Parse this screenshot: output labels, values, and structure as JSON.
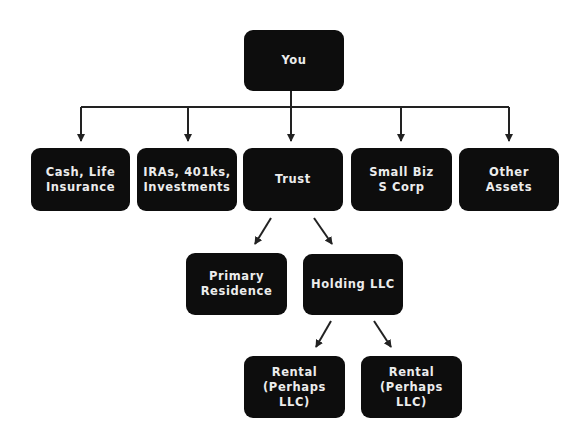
{
  "diagram": {
    "type": "hierarchy",
    "root": {
      "id": "you",
      "label": "You"
    },
    "level1": [
      {
        "id": "cash",
        "label": "Cash, Life Insurance",
        "lines": [
          "Cash, Life",
          "Insurance"
        ]
      },
      {
        "id": "iras",
        "label": "IRAs, 401ks, Investments",
        "lines": [
          "IRAs, 401ks,",
          "Investments"
        ]
      },
      {
        "id": "trust",
        "label": "Trust",
        "lines": [
          "Trust"
        ]
      },
      {
        "id": "smallbiz",
        "label": "Small Biz S Corp",
        "lines": [
          "Small Biz",
          "S Corp"
        ]
      },
      {
        "id": "other",
        "label": "Other Assets",
        "lines": [
          "Other",
          "Assets"
        ]
      }
    ],
    "level2": [
      {
        "id": "primary",
        "parent": "trust",
        "lines": [
          "Primary",
          "Residence"
        ]
      },
      {
        "id": "holding",
        "parent": "trust",
        "lines": [
          "Holding LLC"
        ]
      }
    ],
    "level3": [
      {
        "id": "rental1",
        "parent": "holding",
        "lines": [
          "Rental",
          "(Perhaps LLC)"
        ]
      },
      {
        "id": "rental2",
        "parent": "holding",
        "lines": [
          "Rental",
          "(Perhaps LLC)"
        ]
      }
    ],
    "edges": [
      [
        "you",
        "cash"
      ],
      [
        "you",
        "iras"
      ],
      [
        "you",
        "trust"
      ],
      [
        "you",
        "smallbiz"
      ],
      [
        "you",
        "other"
      ],
      [
        "trust",
        "primary"
      ],
      [
        "trust",
        "holding"
      ],
      [
        "holding",
        "rental1"
      ],
      [
        "holding",
        "rental2"
      ]
    ],
    "colors": {
      "node_fill": "#0d0d0d",
      "node_text": "#ececec",
      "connector": "#222222",
      "background": "#ffffff"
    }
  }
}
